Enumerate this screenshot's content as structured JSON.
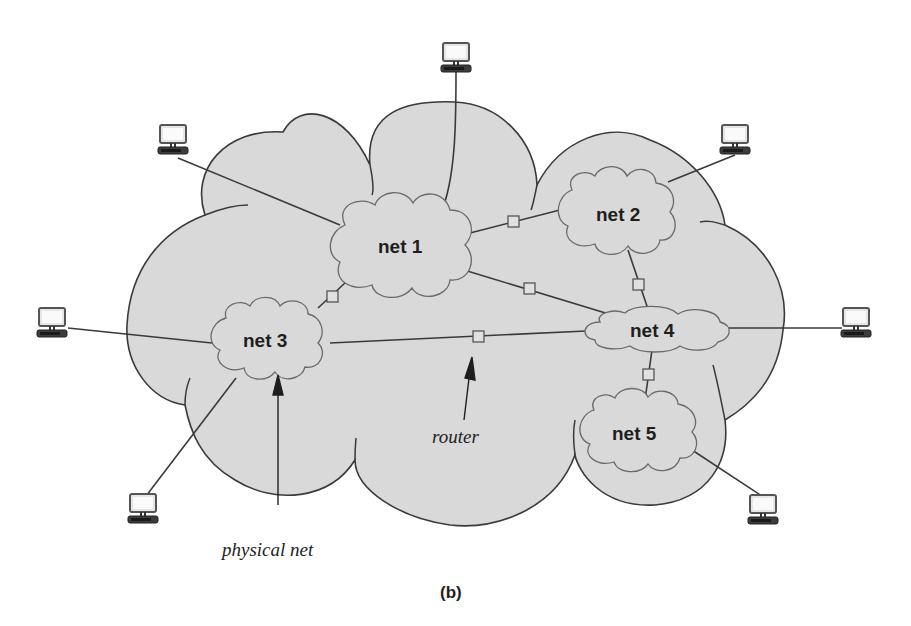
{
  "diagram": {
    "caption": "(b)",
    "colors": {
      "cloud_fill": "#d9d9d9",
      "outline": "#3a3a3a",
      "small_cloud_outline": "#6a6a6a",
      "text": "#1e1e1e"
    },
    "networks": [
      {
        "id": "net1",
        "label": "net 1"
      },
      {
        "id": "net2",
        "label": "net 2"
      },
      {
        "id": "net3",
        "label": "net 3"
      },
      {
        "id": "net4",
        "label": "net 4"
      },
      {
        "id": "net5",
        "label": "net 5"
      }
    ],
    "routers": [
      {
        "between": [
          "net1",
          "net2"
        ]
      },
      {
        "between": [
          "net1",
          "net3"
        ]
      },
      {
        "between": [
          "net1",
          "net4"
        ]
      },
      {
        "between": [
          "net2",
          "net4"
        ]
      },
      {
        "between": [
          "net3",
          "net4"
        ]
      },
      {
        "between": [
          "net4",
          "net5"
        ]
      }
    ],
    "hosts": [
      {
        "attached_to": "net1",
        "position": "top"
      },
      {
        "attached_to": "net1",
        "position": "upper-left"
      },
      {
        "attached_to": "net2",
        "position": "upper-right"
      },
      {
        "attached_to": "net3",
        "position": "left"
      },
      {
        "attached_to": "net3",
        "position": "lower-left"
      },
      {
        "attached_to": "net4",
        "position": "right"
      },
      {
        "attached_to": "net5",
        "position": "lower-right"
      }
    ],
    "annotations": {
      "router": "router",
      "physical_net": "physical net"
    },
    "icons": {
      "host": "computer-icon",
      "router": "router-box-icon",
      "network": "cloud-icon"
    }
  }
}
